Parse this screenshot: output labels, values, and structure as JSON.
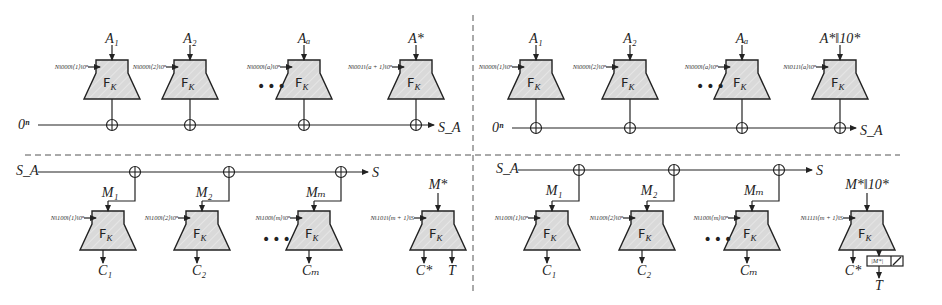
{
  "figure": {
    "panels": {
      "top_left": {
        "name": "associated-data-processing",
        "init": "0ⁿ",
        "output": "S_A",
        "blocks": [
          {
            "input": "A₁",
            "tweak": "N‖000‖⟨1⟩‖0ⁿ",
            "func": "F",
            "key": "K"
          },
          {
            "input": "A₂",
            "tweak": "N‖000‖⟨2⟩‖0ⁿ",
            "func": "F",
            "key": "K"
          },
          {
            "input": "Aₐ",
            "tweak": "N‖000‖⟨a⟩‖0ⁿ",
            "func": "F",
            "key": "K"
          },
          {
            "input": "A*",
            "tweak": "N‖001‖⟨a + 1⟩‖0ⁿ",
            "func": "F",
            "key": "K"
          }
        ],
        "ellipsis": "•••"
      },
      "top_right": {
        "name": "associated-data-processing-padded",
        "init": "0ⁿ",
        "output": "S_A",
        "blocks": [
          {
            "input": "A₁",
            "tweak": "N‖000‖⟨1⟩‖0ⁿ",
            "func": "F",
            "key": "K"
          },
          {
            "input": "A₂",
            "tweak": "N‖000‖⟨2⟩‖0ⁿ",
            "func": "F",
            "key": "K"
          },
          {
            "input": "Aₐ",
            "tweak": "N‖000‖⟨a⟩‖0ⁿ",
            "func": "F",
            "key": "K"
          },
          {
            "input": "A*‖10*",
            "tweak": "N‖011‖⟨a⟩‖0ⁿ",
            "func": "F",
            "key": "K"
          }
        ],
        "ellipsis": "•••"
      },
      "bottom_left": {
        "name": "message-encryption",
        "init": "S_A",
        "output": "S",
        "blocks": [
          {
            "input": "M₁",
            "tweak": "N‖100‖⟨1⟩‖0ⁿ",
            "func": "F",
            "key": "K",
            "out": "C₁"
          },
          {
            "input": "M₂",
            "tweak": "N‖100‖⟨2⟩‖0ⁿ",
            "func": "F",
            "key": "K",
            "out": "C₂"
          },
          {
            "input": "Mₘ",
            "tweak": "N‖100‖⟨m⟩‖0ⁿ",
            "func": "F",
            "key": "K",
            "out": "Cₘ"
          },
          {
            "input": "M*",
            "tweak": "N‖101‖⟨m + 1⟩‖S",
            "func": "F",
            "key": "K",
            "out": "C*",
            "out2": "T"
          }
        ],
        "ellipsis": "•••"
      },
      "bottom_right": {
        "name": "message-encryption-padded",
        "init": "S_A",
        "output": "S",
        "blocks": [
          {
            "input": "M₁",
            "tweak": "N‖100‖⟨1⟩‖0ⁿ",
            "func": "F",
            "key": "K",
            "out": "C₁"
          },
          {
            "input": "M₂",
            "tweak": "N‖100‖⟨2⟩‖0ⁿ",
            "func": "F",
            "key": "K",
            "out": "C₂"
          },
          {
            "input": "Mₘ",
            "tweak": "N‖100‖⟨m⟩‖0ⁿ",
            "func": "F",
            "key": "K",
            "out": "Cₘ"
          },
          {
            "input": "M*‖10*",
            "tweak": "N‖111‖⟨m + 1⟩‖S",
            "func": "F",
            "key": "K",
            "out": "C*",
            "out2": "T",
            "trunc": "|M*|"
          }
        ],
        "ellipsis": "•••"
      }
    },
    "colors": {
      "block_fill": "#d9d9d9",
      "stroke": "#222222",
      "divider": "#555555",
      "background": "#ffffff"
    }
  }
}
